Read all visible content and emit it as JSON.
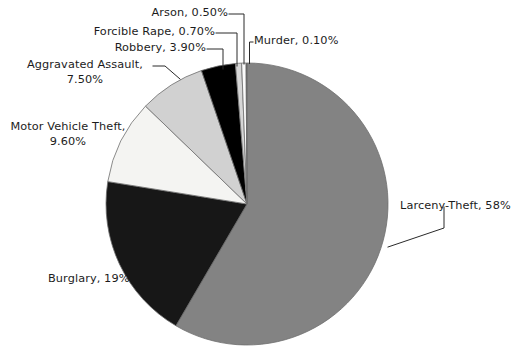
{
  "chart_data": {
    "type": "pie",
    "title": "",
    "subtitle": "",
    "xlabel": "",
    "ylabel": "",
    "legend_position": "none",
    "grid": false,
    "labels_show_percent": true,
    "start_angle_deg": 0,
    "direction": "clockwise",
    "categories": [
      "Larceny-Theft",
      "Burglary",
      "Motor Vehicle Theft",
      "Aggravated Assault",
      "Robbery",
      "Forcible Rape",
      "Arson",
      "Murder"
    ],
    "values": [
      58,
      19,
      9.6,
      7.5,
      3.9,
      0.7,
      0.5,
      0.1
    ],
    "value_labels": [
      "58%",
      "19%",
      "9.60%",
      "7.50%",
      "3.90%",
      "0.70%",
      "0.50%",
      "0.10%"
    ],
    "colors": [
      "#838383",
      "#171717",
      "#f4f4f2",
      "#d1d1d1",
      "#000000",
      "#d6d6d6",
      "#fbfbfb",
      "#4a4a4a"
    ],
    "slices": [
      {
        "name": "Larceny-Theft",
        "value": 58,
        "value_label": "58%",
        "color": "#838383"
      },
      {
        "name": "Burglary",
        "value": 19,
        "value_label": "19%",
        "color": "#171717"
      },
      {
        "name": "Motor Vehicle Theft",
        "value": 9.6,
        "value_label": "9.60%",
        "color": "#f4f4f2"
      },
      {
        "name": "Aggravated Assault",
        "value": 7.5,
        "value_label": "7.50%",
        "color": "#d1d1d1"
      },
      {
        "name": "Robbery",
        "value": 3.9,
        "value_label": "3.90%",
        "color": "#000000"
      },
      {
        "name": "Forcible Rape",
        "value": 0.7,
        "value_label": "0.70%",
        "color": "#d6d6d6"
      },
      {
        "name": "Arson",
        "value": 0.5,
        "value_label": "0.50%",
        "color": "#fbfbfb"
      },
      {
        "name": "Murder",
        "value": 0.1,
        "value_label": "0.10%",
        "color": "#4a4a4a"
      }
    ]
  },
  "labels": {
    "arson": "Arson, 0.50%",
    "forcible_rape": "Forcible Rape, 0.70%",
    "robbery": "Robbery, 3.90%",
    "murder": "Murder, 0.10%",
    "aggravated_assault_line1": "Aggravated Assault,",
    "aggravated_assault_line2": "7.50%",
    "motor_vehicle_theft_line1": "Motor Vehicle Theft,",
    "motor_vehicle_theft_line2": "9.60%",
    "burglary": "Burglary, 19%",
    "larceny_theft": "Larceny-Theft, 58%"
  },
  "geometry": {
    "center_x": 247,
    "center_y": 204,
    "radius": 141,
    "background": "#ffffff",
    "outline_color": "#6f6f6f"
  }
}
